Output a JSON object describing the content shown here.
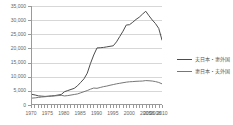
{
  "chart_data": {
    "type": "line",
    "title": "",
    "xlabel": "",
    "ylabel": "",
    "grid": true,
    "legend_position": "right",
    "xlim": [
      1970,
      2010
    ],
    "ylim": [
      0,
      35000
    ],
    "y_ticks": [
      0,
      5000,
      10000,
      15000,
      20000,
      25000,
      30000,
      35000
    ],
    "y_tick_labels": [
      "0",
      "5,000",
      "10,000",
      "15,000",
      "20,000",
      "25,000",
      "30,000",
      "35,000"
    ],
    "x_tick_labels": [
      "1970",
      "1975",
      "1980",
      "1985",
      "1990",
      "1995",
      "2000",
      "2005",
      "2006",
      "2008",
      "2010"
    ],
    "x_tick_values": [
      1970,
      1975,
      1980,
      1985,
      1990,
      1995,
      2000,
      2005,
      2006,
      2008,
      2010
    ],
    "x_minor_ticks": [
      1970,
      1971,
      1972,
      1973,
      1974,
      1975,
      1976,
      1977,
      1978,
      1979,
      1980,
      1981,
      1982,
      1983,
      1984,
      1985,
      1986,
      1987,
      1988,
      1989,
      1990,
      1991,
      1992,
      1993,
      1994,
      1995,
      1996,
      1997,
      1998,
      1999,
      2000,
      2001,
      2002,
      2003,
      2004,
      2005,
      2006,
      2007,
      2008,
      2009,
      2010
    ],
    "series": [
      {
        "name": "夫日本・妻外国",
        "color": "#4d4d4d",
        "x": [
          1970,
          1971,
          1972,
          1973,
          1974,
          1975,
          1976,
          1977,
          1978,
          1979,
          1980,
          1981,
          1982,
          1983,
          1984,
          1985,
          1986,
          1987,
          1988,
          1989,
          1990,
          1991,
          1992,
          1993,
          1994,
          1995,
          1996,
          1997,
          1998,
          1999,
          2000,
          2001,
          2002,
          2003,
          2004,
          2005,
          2006,
          2007,
          2008,
          2009,
          2010
        ],
        "values": [
          3438,
          3200,
          2900,
          2800,
          2700,
          2800,
          2900,
          3000,
          3200,
          3400,
          4386,
          4800,
          5200,
          5600,
          6500,
          7738,
          9000,
          11000,
          14500,
          17500,
          20026,
          20100,
          20200,
          20400,
          20600,
          20787,
          22200,
          24100,
          26000,
          28200,
          28326,
          29200,
          30200,
          31000,
          32100,
          33116,
          31500,
          30000,
          28700,
          27000,
          22843
        ]
      },
      {
        "name": "妻日本・夫外国",
        "color": "#777777",
        "x": [
          1970,
          1971,
          1972,
          1973,
          1974,
          1975,
          1976,
          1977,
          1978,
          1979,
          1980,
          1981,
          1982,
          1983,
          1984,
          1985,
          1986,
          1987,
          1988,
          1989,
          1990,
          1991,
          1992,
          1993,
          1994,
          1995,
          1996,
          1997,
          1998,
          1999,
          2000,
          2001,
          2002,
          2003,
          2004,
          2005,
          2006,
          2007,
          2008,
          2009,
          2010
        ],
        "values": [
          2108,
          2200,
          2350,
          2500,
          2600,
          2700,
          2800,
          2900,
          3000,
          3100,
          2875,
          3000,
          3200,
          3400,
          3600,
          4000,
          4400,
          4800,
          5300,
          5700,
          5600,
          5900,
          6200,
          6400,
          6700,
          6940,
          7200,
          7400,
          7600,
          7800,
          7937,
          8000,
          8100,
          8150,
          8200,
          8365,
          8300,
          8200,
          8000,
          7700,
          7200
        ]
      }
    ]
  },
  "legend": {
    "items": [
      {
        "label": "夫日本・妻外国"
      },
      {
        "label": "妻日本・夫外国"
      }
    ]
  }
}
